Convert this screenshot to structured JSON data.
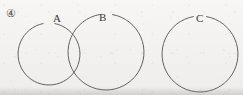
{
  "figure": {
    "item_number": "④",
    "background_color": "#f4f3f1",
    "stroke_color": "#55524e",
    "label_color": "#3a3836",
    "width": 243,
    "height": 95,
    "circles": [
      {
        "label": "A",
        "cx": 49,
        "cy": 54,
        "r": 31,
        "label_x": 57,
        "label_y": 13,
        "gap_degrees": 22,
        "clipped_bottom": true
      },
      {
        "label": "B",
        "cx": 106,
        "cy": 52,
        "r": 38,
        "label_x": 103,
        "label_y": 12,
        "gap_degrees": 20,
        "clipped_bottom": true
      },
      {
        "label": "C",
        "cx": 200,
        "cy": 54,
        "r": 38,
        "label_x": 200,
        "label_y": 13,
        "gap_degrees": 20,
        "clipped_bottom": true
      }
    ],
    "overlaps": [
      {
        "sets": "A-B",
        "type": "intersecting"
      },
      {
        "sets": "C",
        "type": "disjoint"
      }
    ]
  }
}
